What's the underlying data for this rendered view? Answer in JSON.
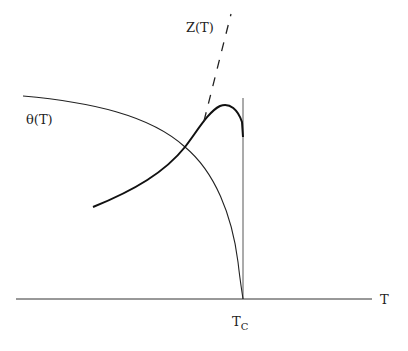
{
  "diagram": {
    "labels": {
      "z_curve": "Z(T)",
      "theta_curve": "θ(T)",
      "x_axis": "T",
      "critical_temp": "T",
      "critical_temp_sub": "C"
    },
    "colors": {
      "stroke": "#222222",
      "background": "#ffffff"
    }
  }
}
